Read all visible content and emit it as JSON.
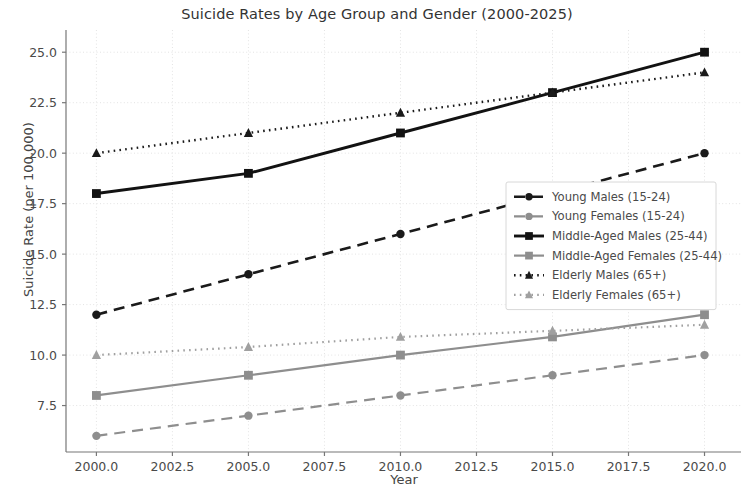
{
  "chart_data": {
    "type": "line",
    "title": "Suicide Rates by Age Group and Gender (2000-2025)",
    "xlabel": "Year",
    "ylabel": "Suicide Rate (per 100,000)",
    "x": [
      2000,
      2005,
      2010,
      2015,
      2020
    ],
    "xlim": [
      1999.0,
      2021.2
    ],
    "ylim": [
      5.2,
      26.1
    ],
    "xticks": [
      "2000.0",
      "2002.5",
      "2005.0",
      "2007.5",
      "2010.0",
      "2012.5",
      "2015.0",
      "2017.5",
      "2020.0"
    ],
    "xtick_values": [
      2000,
      2002.5,
      2005,
      2007.5,
      2010,
      2012.5,
      2015,
      2017.5,
      2020
    ],
    "yticks": [
      "7.5",
      "10.0",
      "12.5",
      "15.0",
      "17.5",
      "20.0",
      "22.5",
      "25.0"
    ],
    "ytick_values": [
      7.5,
      10.0,
      12.5,
      15.0,
      17.5,
      20.0,
      22.5,
      25.0
    ],
    "grid": true,
    "legend_position": "center right",
    "series": [
      {
        "name": "Young Males (15-24)",
        "values": [
          12,
          14,
          16,
          18,
          20
        ],
        "color": "#1a1a1a",
        "dash": "11,7",
        "width": 2.6,
        "marker": "circle"
      },
      {
        "name": "Young Females (15-24)",
        "values": [
          6,
          7,
          8,
          9,
          10
        ],
        "color": "#8e8e8e",
        "dash": "11,7",
        "width": 2.2,
        "marker": "circle"
      },
      {
        "name": "Middle-Aged Males (25-44)",
        "values": [
          18,
          19,
          21,
          23,
          25
        ],
        "color": "#121212",
        "dash": "none",
        "width": 2.9,
        "marker": "square"
      },
      {
        "name": "Middle-Aged Females (25-44)",
        "values": [
          8,
          9,
          10,
          10.9,
          12
        ],
        "color": "#8e8e8e",
        "dash": "none",
        "width": 2.2,
        "marker": "square"
      },
      {
        "name": "Elderly Males (65+)",
        "values": [
          20,
          21,
          22,
          23,
          24
        ],
        "color": "#1a1a1a",
        "dash": "1.6,4.2",
        "width": 2.4,
        "marker": "triangle"
      },
      {
        "name": "Elderly Females (65+)",
        "values": [
          10,
          10.4,
          10.9,
          11.2,
          11.5
        ],
        "color": "#a0a0a0",
        "dash": "1.6,4.2",
        "width": 2.2,
        "marker": "triangle"
      }
    ]
  },
  "axes": {
    "spine_color": "#777777",
    "grid_color": "#e3e3e3",
    "tick_color": "#777777"
  },
  "legend": {
    "border_color": "#d8d8d8",
    "background": "#ffffff"
  }
}
